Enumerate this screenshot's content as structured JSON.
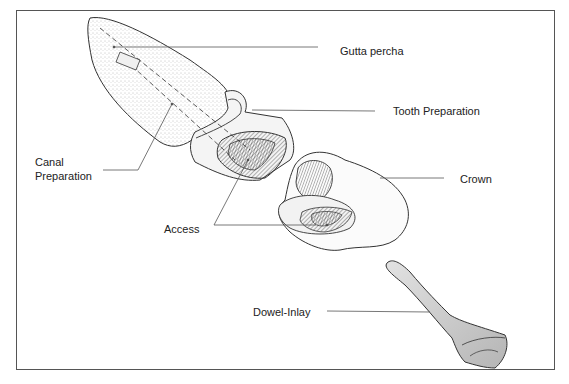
{
  "diagram": {
    "type": "dental illustration",
    "labels": {
      "gutta_percha": "Gutta percha",
      "tooth_preparation": "Tooth Preparation",
      "canal_preparation_line1": "Canal",
      "canal_preparation_line2": "Preparation",
      "crown": "Crown",
      "access": "Access",
      "dowel_inlay": "Dowel-Inlay"
    },
    "components": [
      "Tooth root with prepared canal",
      "Crown",
      "Dowel-Inlay"
    ],
    "colors": {
      "line": "#333333",
      "frame": "#555555",
      "stipple": "#8a8a8a",
      "dowel_fill": "#c8c8c8",
      "background": "#ffffff"
    }
  }
}
